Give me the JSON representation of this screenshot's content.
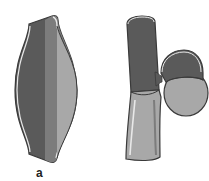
{
  "diagram": {
    "panels": [
      {
        "id": "a",
        "label": "a",
        "depiction": "fusiform-vessel-dilation"
      },
      {
        "id": "b",
        "label": "b",
        "depiction": "saccular-outpouching-on-vessel"
      }
    ],
    "colors": {
      "dark_wall": "#5a5a5a",
      "mid_wall": "#7c7c7c",
      "light_wall": "#a8a8a8",
      "outline": "#3a3a3a",
      "highlight": "#e8e8e8"
    }
  }
}
